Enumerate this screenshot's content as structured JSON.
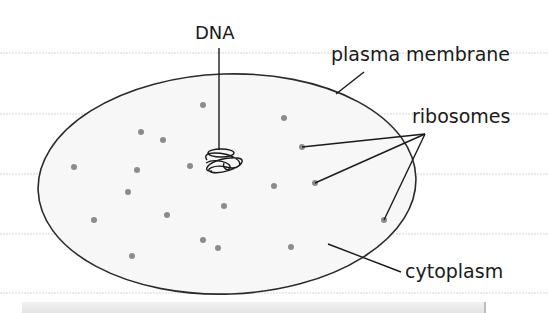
{
  "diagram": {
    "labels": {
      "dna": "DNA",
      "plasma_membrane": "plasma membrane",
      "ribosomes": "ribosomes",
      "cytoplasm": "cytoplasm"
    },
    "colors": {
      "outline": "#2a2a2a",
      "cell_fill": "#f7f7f7",
      "ribosome": "#8c8c8c",
      "rule_line": "#d6d6d6"
    },
    "cell": {
      "cx": 227,
      "cy": 184,
      "rx": 189,
      "ry": 110
    },
    "ribosomes": [
      [
        203,
        105
      ],
      [
        141,
        132
      ],
      [
        163,
        140
      ],
      [
        74,
        167
      ],
      [
        137,
        170
      ],
      [
        190,
        166
      ],
      [
        128,
        192
      ],
      [
        224,
        206
      ],
      [
        94,
        220
      ],
      [
        167,
        215
      ],
      [
        203,
        240
      ],
      [
        218,
        248
      ],
      [
        132,
        256
      ],
      [
        284,
        118
      ],
      [
        302,
        147
      ],
      [
        274,
        186
      ],
      [
        315,
        183
      ],
      [
        384,
        220
      ],
      [
        291,
        247
      ]
    ],
    "rule_lines_y": [
      53,
      114,
      174,
      234,
      293
    ]
  }
}
